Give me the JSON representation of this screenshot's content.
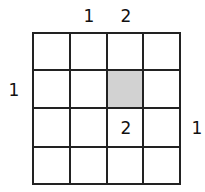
{
  "puzzle": {
    "rows": 4,
    "cols": 4,
    "top_clues": [
      "",
      "1",
      "2",
      ""
    ],
    "left_clues": [
      "",
      "1",
      "",
      ""
    ],
    "right_clues": [
      "",
      "",
      "1",
      ""
    ],
    "cell_numbers": [
      [
        "",
        "",
        "",
        ""
      ],
      [
        "",
        "",
        "",
        ""
      ],
      [
        "",
        "",
        "2",
        ""
      ],
      [
        "",
        "",
        "",
        ""
      ]
    ],
    "shaded_cells": [
      [
        1,
        2
      ]
    ],
    "shade_color": "#d2d2d2"
  }
}
